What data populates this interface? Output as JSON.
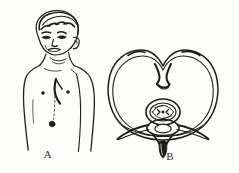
{
  "figure": {
    "kind": "medical-line-illustration",
    "title_visible": false,
    "background_color": "#fdfdfc",
    "ink_color": "#1f1c1a",
    "width": 239,
    "height": 173
  },
  "panels": [
    {
      "id": "A",
      "label": "A",
      "subject": "child-with-goiter-torso-view",
      "description_parts": [
        "head-with-short-hair",
        "face-eyes-nose-mouth",
        "ear",
        "neck-with-anterior-swelling",
        "bare-chest-and-shoulders",
        "nipple-marks",
        "sternal-midline-shading",
        "right-arm"
      ]
    },
    {
      "id": "B",
      "label": "B",
      "subject": "thyroid-cross-section-transverse",
      "description_parts": [
        "enlarged-thyroid-butterfly-outline",
        "left-lobe",
        "right-lobe",
        "isthmus-notch",
        "thyroid-capsule-double-line",
        "trachea-oval-with-lumen",
        "vertebral-body",
        "transverse-processes",
        "vertebral-foramen",
        "spinous-process"
      ]
    }
  ],
  "labels": {
    "panel_a": "A",
    "panel_b": "B"
  }
}
